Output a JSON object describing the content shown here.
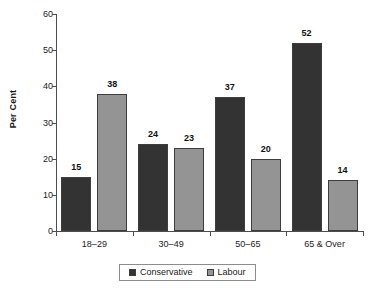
{
  "chart_data": {
    "type": "bar",
    "title": "",
    "xlabel": "",
    "ylabel": "Per Cent",
    "categories": [
      "18–29",
      "30–49",
      "50–65",
      "65 & Over"
    ],
    "series": [
      {
        "name": "Conservative",
        "color": "#333333",
        "values": [
          15,
          24,
          37,
          52
        ]
      },
      {
        "name": "Labour",
        "color": "#949494",
        "values": [
          38,
          23,
          20,
          14
        ]
      }
    ],
    "ylim": [
      0,
      60
    ],
    "yticks": [
      0,
      10,
      20,
      30,
      40,
      50,
      60
    ],
    "ytick_labels": [
      "0",
      "10",
      "20",
      "30",
      "40",
      "50",
      "60"
    ],
    "data_labels": [
      [
        "15",
        "38"
      ],
      [
        "24",
        "23"
      ],
      [
        "37",
        "20"
      ],
      [
        "52",
        "14"
      ]
    ],
    "grid": false,
    "legend_position": "bottom-center",
    "legend_entries": [
      "Conservative",
      "Labour"
    ]
  }
}
